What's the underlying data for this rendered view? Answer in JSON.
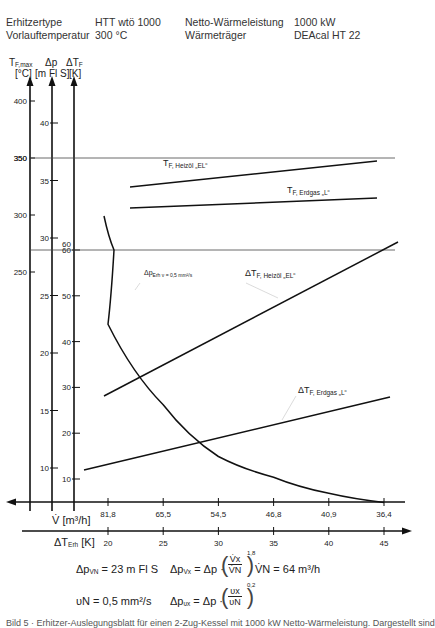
{
  "header": {
    "rows": [
      {
        "label": "Erhitzertype",
        "value": "HTT wtö 1000",
        "label2": "Netto-Wärmeleistung",
        "value2": "1000 kW"
      },
      {
        "label": "Vorlauftemperatur",
        "value": "300 °C",
        "label2": "Wärmeträger",
        "value2": "DEAcal HT 22"
      }
    ]
  },
  "axes_labels": {
    "tf_max": {
      "symbol": "T",
      "sub": "F,max",
      "unit": "[°C]"
    },
    "dp": {
      "symbol": "Δp",
      "unit": "[m Fl S]"
    },
    "dtf": {
      "symbol": "ΔT",
      "sub": "F",
      "unit": "[K]"
    },
    "v": "V̇ [m³/h]",
    "dt_erh": {
      "symbol": "ΔT",
      "sub": "Erh",
      "unit": "[K]"
    }
  },
  "formulas": {
    "dp_vn": "Δp",
    "dp_vn_sub": "VN",
    "dp_vn_val": "= 23 m Fl S",
    "dp_vx": "Δp",
    "dp_vx_sub": "Vx",
    "dp_vx_rhs": "= Δp ·",
    "exp1": "1,8",
    "frac1_num": "V̇x",
    "frac1_den": "V̇N",
    "vn": "V̇N = 64 m³/h",
    "nu_n": "υN = 0,5 mm²/s",
    "dp_nux": "Δp",
    "dp_nux_sub": "υx",
    "dp_nux_rhs": "= Δp ·",
    "exp2": "0,2",
    "frac2_num": "υx",
    "frac2_den": "υN"
  },
  "caption": "Bild 5 · Erhitzer-Auslegungsblatt für einen 2-Zug-Kessel mit 1000 kW Netto-Wärmeleistung. Dargestellt sind",
  "chart_data": {
    "type": "line",
    "title": "",
    "x_axes": [
      {
        "name": "ΔT_Erh [K]",
        "ticks": [
          20,
          25,
          30,
          35,
          40,
          45
        ],
        "range": [
          20,
          45
        ]
      },
      {
        "name": "V̇ [m³/h]",
        "ticks": [
          "81,8",
          "65,5",
          "54,5",
          "46,8",
          "40,9",
          "36,4"
        ]
      }
    ],
    "y_axes": [
      {
        "name": "T_F,max [°C]",
        "ticks": [
          250,
          300,
          350,
          400
        ]
      },
      {
        "name": "Δp [m Fl S]",
        "ticks": [
          10,
          15,
          20,
          25,
          30,
          35,
          40
        ]
      },
      {
        "name": "ΔT_F [K]",
        "ticks": [
          10,
          20,
          30,
          40,
          50,
          60
        ]
      }
    ],
    "reference_lines": [
      {
        "axis": "T_F,max",
        "value": 350,
        "label": "350"
      },
      {
        "axis": "ΔT_F",
        "value": 60,
        "label": "60"
      }
    ],
    "series": [
      {
        "name": "T_F, Heizöl „EL“",
        "axis": "T_F,max",
        "x": [
          20,
          45
        ],
        "values": [
          332,
          358
        ]
      },
      {
        "name": "T_F, Erdgas „L“",
        "axis": "T_F,max",
        "x": [
          20,
          45
        ],
        "values": [
          310,
          321
        ]
      },
      {
        "name": "Δp_Erh ν = 0,5 mm²/s",
        "axis": "Δp",
        "x": [
          20,
          25,
          30,
          35,
          40,
          45
        ],
        "values": [
          22.5,
          15.5,
          11.0,
          9.2,
          7.8,
          7.0
        ]
      },
      {
        "name": "ΔT_F, Heizöl „EL“",
        "axis": "ΔT_F",
        "x": [
          20,
          45
        ],
        "values": [
          29.5,
          62.5
        ]
      },
      {
        "name": "ΔT_F, Erdgas „L“",
        "axis": "ΔT_F",
        "x": [
          18,
          45
        ],
        "values": [
          12.5,
          29
        ]
      }
    ]
  }
}
